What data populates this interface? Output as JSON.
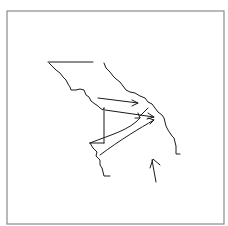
{
  "figure": {
    "type": "hand-drawn sketch",
    "stroke_color": "#1a1a1a",
    "frame_color": "#8a8a8a",
    "background": "#ffffff"
  },
  "frame": {
    "x": 7,
    "y": 11,
    "width": 217,
    "height": 213
  },
  "paths": {
    "top_line": "M48,62 L93,62",
    "left_bank": "M49,63 L53,67 L56,70 L60,73 L63,77 L66,80 L68,84 L70,87 L71,90 L76,90 L80,89 L84,90 L86,95 L89,97 L91,101 L95,104 L98,106 L100,108 L103,110 L104,108",
    "left_bank_lower": "M90,143 L93,148 L97,152 L96,156 L100,160 L100,165 L102,168 L103,172 L104,176 L110,176",
    "right_bank": "M104,63 L106,68 L110,72 L113,76 L116,79 L120,82 L123,86 L126,90 L130,92 L135,93 L140,96 L145,98 L148,102 L152,104 L155,108 L158,112 L162,115 L164,118 L165,122 L166,126 L168,130 L170,133 L172,136 L174,138 L175,142 L176,146 L176,150 L176,154 L180,154",
    "vertical_line": "M104,108 L104,143",
    "triangle_base": "M90,143 L104,143",
    "arrow_1": "M98,98 L138,103",
    "arrow_2": "M105,110 L154,117",
    "arrow_3": "M90,143 C110,135 130,130 140,118",
    "arrow_3b": "M90,143 L104,143",
    "arrow_4": "M100,155 C120,140 140,128 154,120",
    "arrow_extra": "M140,116 L148,108",
    "small_arrow": "M156,182 L152,160 M150,168 L153,159 L160,165"
  },
  "arrowheads": {
    "arrow_1": "M132,100 L138,103 L132,106",
    "arrow_2": "M148,113 L154,117 L147,119",
    "arrow_3": "M135,118 L140,118 L138,113",
    "arrow_4": "M148,118 L154,120 L150,124"
  }
}
